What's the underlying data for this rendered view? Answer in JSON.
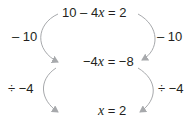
{
  "equations": {
    "line1": {
      "pre": "10 – 4",
      "var": "x",
      "post": " = 2"
    },
    "line2": {
      "pre": "−4",
      "var": "x",
      "post": " = −8"
    },
    "line3": {
      "pre": "",
      "var": "x",
      "post": " = 2"
    }
  },
  "operations": {
    "left1": "– 10",
    "right1": "– 10",
    "left2": "÷ −4",
    "right2": "÷ −4"
  },
  "colors": {
    "arrow": "#a7a9ac",
    "text": "#231f20"
  }
}
